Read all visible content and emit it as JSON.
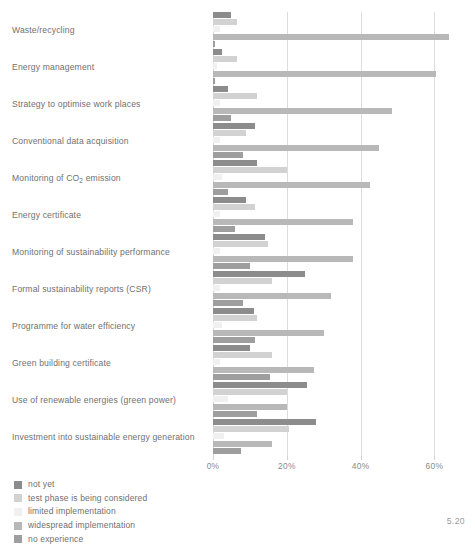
{
  "figure": {
    "number": "5.20"
  },
  "chart_data": {
    "type": "bar",
    "orientation": "horizontal",
    "title": "",
    "xlabel": "",
    "ylabel": "",
    "xlim": [
      0,
      71
    ],
    "xticks": [
      0,
      20,
      40,
      60
    ],
    "xtick_labels": [
      "0%",
      "20%",
      "40%",
      "60%"
    ],
    "grid": true,
    "legend_position": "bottom-left",
    "categories": [
      "Waste/recycling",
      "Energy management",
      "Strategy to optimise work places",
      "Conventional data acquisition",
      "Monitoring of CO2 emission",
      "Energy certificate",
      "Monitoring of sustainability performance",
      "Formal sustainability reports (CSR)",
      "Programme for water efficiency",
      "Green building certificate",
      "Use of renewable energies (green power)",
      "Investment into sustainable energy generation"
    ],
    "series": [
      {
        "name": "not yet",
        "color": "#8c8c8c",
        "values": [
          5.0,
          2.5,
          4.0,
          11.5,
          12.0,
          9.0,
          14.0,
          25.0,
          11.0,
          10.0,
          25.5,
          28.0
        ]
      },
      {
        "name": "test phase is being considered",
        "color": "#d2d2d2",
        "values": [
          6.5,
          6.5,
          12.0,
          9.0,
          20.0,
          11.5,
          15.0,
          16.0,
          12.0,
          16.0,
          20.0,
          20.5
        ]
      },
      {
        "name": "limited implementation",
        "color": "#f0f0f0",
        "values": [
          2.0,
          1.0,
          2.0,
          2.0,
          2.5,
          2.0,
          2.0,
          2.0,
          2.5,
          2.0,
          4.0,
          3.0
        ]
      },
      {
        "name": "widespread implementation",
        "color": "#b8b8b8",
        "values": [
          64.0,
          60.5,
          48.5,
          45.0,
          42.5,
          38.0,
          38.0,
          32.0,
          30.0,
          27.5,
          20.0,
          16.0
        ]
      },
      {
        "name": "no experience",
        "color": "#9e9e9e",
        "values": [
          0.5,
          0.5,
          5.0,
          8.0,
          4.0,
          6.0,
          10.0,
          8.0,
          11.5,
          15.5,
          12.0,
          7.5
        ]
      }
    ]
  },
  "legend": {
    "items": [
      {
        "label": "not yet",
        "color": "#8c8c8c"
      },
      {
        "label": "test phase is being considered",
        "color": "#d2d2d2"
      },
      {
        "label": "limited implementation",
        "color": "#f0f0f0"
      },
      {
        "label": "widespread implementation",
        "color": "#b8b8b8"
      },
      {
        "label": "no experience",
        "color": "#9e9e9e"
      }
    ]
  }
}
